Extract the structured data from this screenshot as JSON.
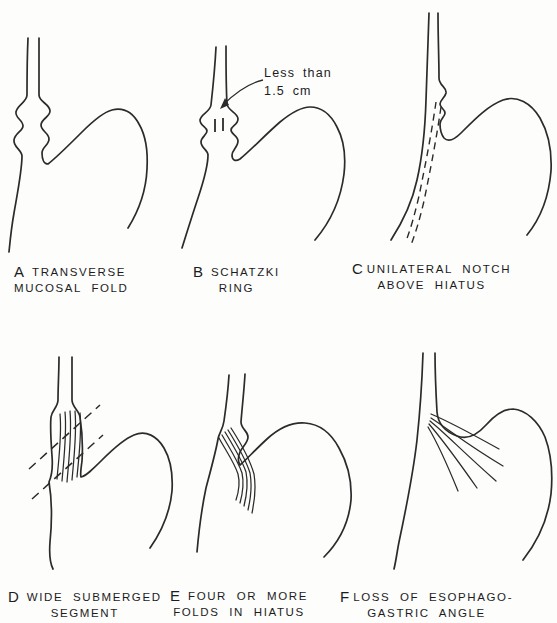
{
  "figure": {
    "colors": {
      "background": "#fdfdfc",
      "line": "#2b2b2b",
      "text": "#1c1c1c"
    },
    "annotation": {
      "line1": "Less than",
      "line2": "1.5 cm"
    },
    "panels": [
      {
        "letter": "A",
        "line1": "TRANSVERSE",
        "line2": "MUCOSAL FOLD"
      },
      {
        "letter": "B",
        "line1": "SCHATZKI",
        "line2": "RING"
      },
      {
        "letter": "C",
        "line1": "UNILATERAL NOTCH",
        "line2": "ABOVE HIATUS"
      },
      {
        "letter": "D",
        "line1": "WIDE SUBMERGED",
        "line2": "SEGMENT"
      },
      {
        "letter": "E",
        "line1": "FOUR OR MORE",
        "line2": "FOLDS IN HIATUS"
      },
      {
        "letter": "F",
        "line1": "LOSS OF ESOPHAGO-",
        "line2": "GASTRIC ANGLE"
      }
    ]
  }
}
